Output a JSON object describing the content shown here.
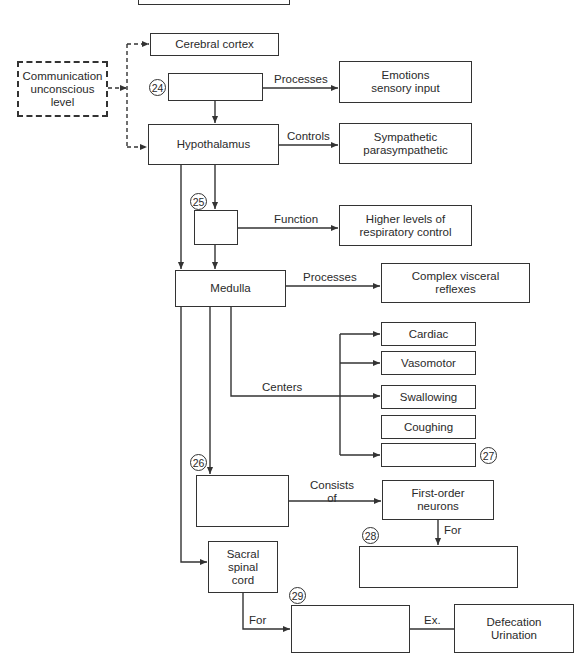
{
  "diagram": {
    "nodes": {
      "top_box": "",
      "cerebral_cortex": "Cerebral cortex",
      "communication": "Communication unconscious level",
      "box24": "",
      "emotions": "Emotions sensory input",
      "hypothalamus": "Hypothalamus",
      "sympathetic": "Sympathetic parasympathetic",
      "box25": "",
      "higher_levels": "Higher levels of respiratory control",
      "medulla": "Medulla",
      "complex_visceral": "Complex visceral reflexes",
      "cardiac": "Cardiac",
      "vasomotor": "Vasomotor",
      "swallowing": "Swallowing",
      "coughing": "Coughing",
      "box27": "",
      "box26": "",
      "first_order": "First-order neurons",
      "box28": "",
      "sacral": "Sacral spinal cord",
      "box29": "",
      "defecation": "Defecation Urination"
    },
    "numbers": {
      "n24": "24",
      "n25": "25",
      "n26": "26",
      "n27": "27",
      "n28": "28",
      "n29": "29"
    },
    "edge_labels": {
      "processes1": "Processes",
      "controls": "Controls",
      "function": "Function",
      "processes2": "Processes",
      "centers": "Centers",
      "consists_of": "Consists of",
      "for1": "For",
      "for2": "For",
      "ex": "Ex."
    }
  }
}
